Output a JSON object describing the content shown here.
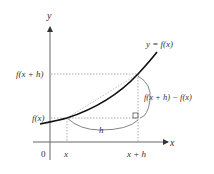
{
  "diagram": {
    "axes": {
      "x_label": "x",
      "y_label": "y",
      "origin_label": "0"
    },
    "ticks": {
      "x": "x",
      "x_plus_h": "x + h",
      "fx": "f(x)",
      "fx_plus_h": "f(x + h)"
    },
    "curve_label": "y = f(x)",
    "horizontal_gap_label": "h",
    "vertical_gap_label": "f(x + h) − f(x)",
    "colors": {
      "curve": "#111111",
      "axis": "#555555",
      "guide": "#888888",
      "text": "#333333"
    }
  }
}
